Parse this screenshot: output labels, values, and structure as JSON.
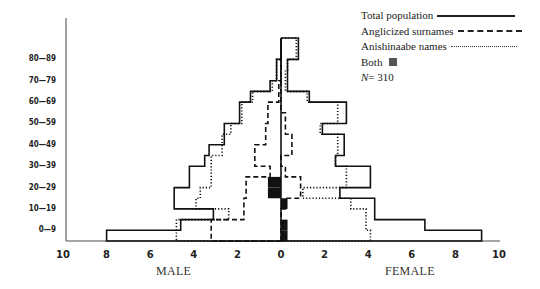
{
  "chart_data": {
    "type": "bar",
    "subtype": "population-pyramid",
    "title": "",
    "xlabel_left": "MALE",
    "xlabel_right": "FEMALE",
    "x_ticks_left": [
      "10",
      "8",
      "6",
      "4",
      "2",
      "0"
    ],
    "x_ticks_right": [
      "2",
      "4",
      "6",
      "8",
      "10"
    ],
    "xlim": [
      -10,
      10
    ],
    "y_tick_labels": [
      "0—9",
      "10—19",
      "20—29",
      "30—39",
      "40—49",
      "50—59",
      "60—69",
      "70—79",
      "80—89"
    ],
    "bins": [
      "0-4",
      "5-9",
      "10-14",
      "15-19",
      "20-24",
      "25-29",
      "30-34",
      "35-39",
      "40-44",
      "45-49",
      "50-54",
      "55-59",
      "60-64",
      "65-69",
      "70-74",
      "75-79",
      "80-84",
      "85-89",
      "90-94"
    ],
    "series": [
      {
        "name": "Total population",
        "style": "solid",
        "male": [
          8.0,
          4.6,
          3.1,
          4.9,
          4.9,
          4.2,
          4.2,
          3.5,
          3.3,
          2.6,
          2.6,
          1.9,
          1.9,
          1.4,
          0.5,
          0.2,
          0.2,
          0.0,
          0.0
        ],
        "female": [
          9.2,
          6.6,
          4.3,
          4.3,
          2.7,
          4.1,
          4.1,
          2.5,
          2.9,
          2.9,
          1.9,
          3.0,
          3.0,
          1.3,
          0.3,
          0.3,
          0.3,
          0.8,
          0.8
        ]
      },
      {
        "name": "Anglicized surnames",
        "style": "dashed",
        "male": [
          3.2,
          3.2,
          1.7,
          1.7,
          1.6,
          1.6,
          0.5,
          1.2,
          1.2,
          0.7,
          0.7,
          0.6,
          0.6,
          0.1,
          0.1,
          0.0,
          0.0,
          0.0,
          0.0
        ],
        "female": [
          0.0,
          0.0,
          0.0,
          0.2,
          0.9,
          0.9,
          0.2,
          0.0,
          0.5,
          0.5,
          0.2,
          0.2,
          0.0,
          0.0,
          0.0,
          0.0,
          0.0,
          0.0,
          0.0
        ]
      },
      {
        "name": "Anishinaabe names",
        "style": "dotted",
        "male": [
          4.8,
          4.8,
          2.4,
          3.9,
          3.7,
          3.2,
          3.2,
          3.2,
          2.7,
          2.7,
          2.3,
          1.8,
          1.8,
          1.3,
          0.4,
          0.2,
          0.2,
          0.0,
          0.0
        ],
        "female": [
          4.1,
          3.9,
          3.9,
          3.2,
          1.0,
          3.0,
          3.0,
          2.5,
          2.6,
          2.6,
          1.8,
          2.6,
          2.6,
          1.2,
          0.2,
          0.2,
          0.3,
          0.7,
          0.7
        ]
      },
      {
        "name": "Both",
        "style": "filled",
        "male": [
          0.0,
          0.0,
          0.0,
          0.0,
          0.6,
          0.6,
          0.0,
          0.0,
          0.0,
          0.0,
          0.0,
          0.0,
          0.0,
          0.0,
          0.0,
          0.0,
          0.0,
          0.0,
          0.0
        ],
        "female": [
          0.3,
          0.3,
          0.0,
          0.3,
          0.0,
          0.0,
          0.0,
          0.0,
          0.0,
          0.0,
          0.0,
          0.0,
          0.0,
          0.0,
          0.0,
          0.0,
          0.0,
          0.0,
          0.0
        ]
      }
    ],
    "legend": {
      "position": "top-right",
      "entries": [
        "Total population",
        "Anglicized surnames",
        "Anishinaabe names",
        "Both"
      ],
      "n_label": "N = 310"
    },
    "grid": false
  },
  "legend": {
    "total": "Total population",
    "anglicized": "Anglicized surnames",
    "anishinaabe": "Anishinaabe names",
    "both": "Both",
    "n_prefix": "N",
    "n_value": " = 310"
  },
  "axis": {
    "y_labels": [
      "0—9",
      "10—19",
      "20—29",
      "30—39",
      "40—49",
      "50—59",
      "60—69",
      "70—79",
      "80—89"
    ],
    "x_labels": [
      "10",
      "8",
      "6",
      "4",
      "2",
      "0",
      "2",
      "4",
      "6",
      "8",
      "10"
    ],
    "male": "MALE",
    "female": "FEMALE"
  }
}
